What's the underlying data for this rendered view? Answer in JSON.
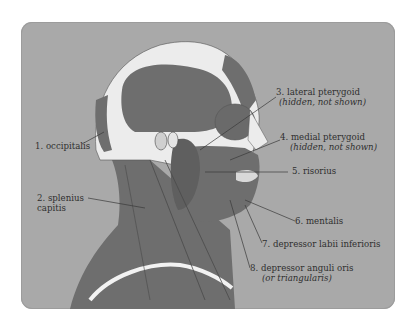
{
  "figure": {
    "colors": {
      "panel": "#a9a9a9",
      "muscle": "#6e6e6e",
      "muscle_dark": "#5c5c5c",
      "bone": "#ececec",
      "skin_light": "#d9d9d9",
      "leader_line": "#3a3a3a",
      "text": "#2f2f2f"
    }
  },
  "labels": [
    {
      "id": 1,
      "text": "1. occipitalis",
      "sub": ""
    },
    {
      "id": 2,
      "text": "2. splenius",
      "sub": "capitis"
    },
    {
      "id": 3,
      "text": "3. lateral pterygoid",
      "sub": "(hidden, not shown)"
    },
    {
      "id": 4,
      "text": "4. medial pterygoid",
      "sub": "(hidden, not shown)"
    },
    {
      "id": 5,
      "text": "5. risorius",
      "sub": ""
    },
    {
      "id": 6,
      "text": "6. mentalis",
      "sub": ""
    },
    {
      "id": 7,
      "text": "7. depressor labii inferioris",
      "sub": ""
    },
    {
      "id": 8,
      "text": "8. depressor anguli oris",
      "sub": "(or triangularis)"
    }
  ]
}
